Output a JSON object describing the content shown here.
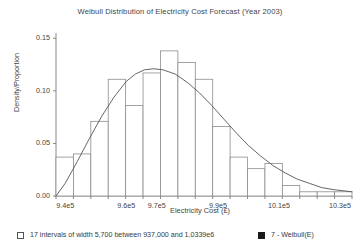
{
  "chart_data": {
    "type": "bar",
    "title": "Weibull Distribution of Electricity Cost Forecast (Year 2003)",
    "xlabel": "Electricity Cost (£)",
    "ylabel": "Density/Proportion",
    "xlim": [
      937000,
      1033900
    ],
    "ylim": [
      0.0,
      0.155
    ],
    "grid": false,
    "legend_position": "bottom",
    "bin_width": 5700,
    "bin_count": 17,
    "bin_start": 937000,
    "bin_end": 1033900,
    "categories": [
      "937000-942700",
      "942700-948400",
      "948400-954100",
      "954100-959800",
      "959800-965500",
      "965500-971200",
      "971200-976900",
      "976900-982600",
      "982600-988300",
      "988300-994000",
      "994000-999700",
      "999700-1005400",
      "1005400-1011100",
      "1011100-1016800",
      "1016800-1022500",
      "1022500-1028200",
      "1028200-1033900"
    ],
    "bin_edges": [
      937000,
      942700,
      948400,
      954100,
      959800,
      965500,
      971200,
      976900,
      982600,
      988300,
      994000,
      999700,
      1005400,
      1011100,
      1016800,
      1022500,
      1028200,
      1033900
    ],
    "values": [
      0.037,
      0.04,
      0.071,
      0.111,
      0.086,
      0.117,
      0.138,
      0.127,
      0.111,
      0.066,
      0.037,
      0.026,
      0.031,
      0.01,
      0.004,
      0.004,
      0.004
    ],
    "series": [
      {
        "name": "17 intervals of width 5,700 between 937,000 and 1.0339e6",
        "type": "histogram",
        "values": [
          0.037,
          0.04,
          0.071,
          0.111,
          0.086,
          0.117,
          0.138,
          0.127,
          0.111,
          0.066,
          0.037,
          0.026,
          0.031,
          0.01,
          0.004,
          0.004,
          0.004
        ]
      },
      {
        "name": "7 - Weibull(E)",
        "type": "line",
        "x": [
          937000,
          940000,
          944000,
          948000,
          952000,
          956000,
          960000,
          963000,
          966000,
          969000,
          972000,
          976000,
          980000,
          984000,
          988000,
          992000,
          996000,
          1000000,
          1004000,
          1008000,
          1012000,
          1016000,
          1020000,
          1024000,
          1028000,
          1033900
        ],
        "values": [
          0.0,
          0.012,
          0.033,
          0.055,
          0.076,
          0.094,
          0.109,
          0.116,
          0.12,
          0.121,
          0.12,
          0.116,
          0.108,
          0.098,
          0.086,
          0.073,
          0.06,
          0.048,
          0.038,
          0.029,
          0.022,
          0.016,
          0.012,
          0.008,
          0.006,
          0.004
        ]
      }
    ],
    "yticks": [
      0.0,
      0.05,
      0.1,
      0.15
    ],
    "ytick_labels": [
      "0.00",
      "0.05",
      "0.10",
      "0.15"
    ],
    "xticks": [
      940000,
      960000,
      970000,
      990000,
      1010000,
      1030000
    ],
    "xtick_labels": [
      "9.4e5",
      "9.6e5",
      "9.7e5",
      "9.9e5",
      "10.1e5",
      "10.3e5"
    ],
    "colors": {
      "histogram_edge": "#8c8c8c",
      "histogram_fill": "#ffffff",
      "curve": "#555555",
      "axis": "#7a7a7a",
      "text": "#3a3a3a",
      "legend_filled": "#1a1a1a"
    }
  },
  "legend": {
    "histogram_label": "17 intervals of width 5,700 between 937,000 and 1.0339e6",
    "curve_label": "7 - Weibull(E)"
  }
}
